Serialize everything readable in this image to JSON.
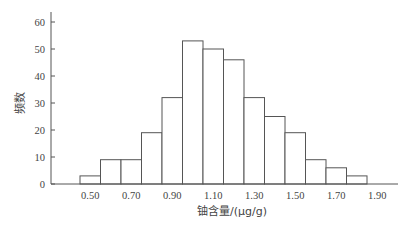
{
  "chart_data": {
    "type": "bar",
    "subtype": "histogram",
    "title": "",
    "xlabel": "铀含量/(μg/g)",
    "ylabel": "频数",
    "bin_edges": [
      0.5,
      0.6,
      0.7,
      0.8,
      0.9,
      1.0,
      1.1,
      1.2,
      1.3,
      1.4,
      1.5,
      1.6,
      1.7,
      1.8,
      1.9
    ],
    "categories": [
      "0.50-0.60",
      "0.60-0.70",
      "0.70-0.80",
      "0.80-0.90",
      "0.90-1.00",
      "1.00-1.10",
      "1.10-1.20",
      "1.20-1.30",
      "1.30-1.40",
      "1.40-1.50",
      "1.50-1.60",
      "1.60-1.70",
      "1.70-1.80",
      "1.80-1.90"
    ],
    "values": [
      3,
      9,
      9,
      19,
      32,
      53,
      50,
      46,
      32,
      25,
      19,
      9,
      6,
      3
    ],
    "xticks": [
      "0.50",
      "0.70",
      "0.90",
      "1.10",
      "1.30",
      "1.50",
      "1.70",
      "1.90"
    ],
    "yticks": [
      "0",
      "10",
      "20",
      "30",
      "40",
      "50",
      "60"
    ],
    "ylim": [
      0,
      65
    ],
    "xlim": [
      0.3,
      2.05
    ],
    "grid": false,
    "legend": null
  }
}
